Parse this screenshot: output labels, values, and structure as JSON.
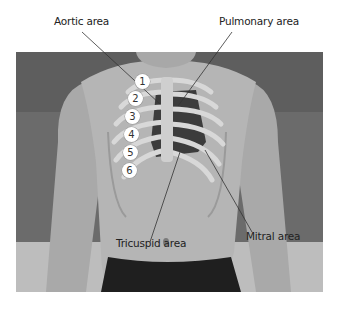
{
  "figure": {
    "labels": {
      "aortic": "Aortic area",
      "pulmonary": "Pulmonary area",
      "tricuspid": "Tricuspid area",
      "mitral": "Mitral area"
    },
    "intercostal_spaces": [
      "1",
      "2",
      "3",
      "4",
      "5",
      "6"
    ],
    "colors": {
      "background": "#ffffff",
      "photo_bg": "#6a6a6a",
      "skin": "#b8b8b8",
      "rib": "#d8d8d8",
      "dark_space": "#3a3a3a",
      "shorts": "#1e1e1e"
    }
  }
}
